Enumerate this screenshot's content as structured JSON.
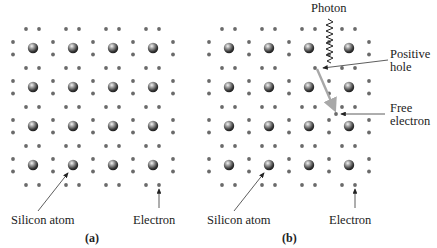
{
  "panels": [
    {
      "id": "a",
      "caption": "(a)",
      "offset_x": 0,
      "labels": {
        "silicon_atom": "Silicon atom",
        "electron": "Electron"
      }
    },
    {
      "id": "b",
      "caption": "(b)",
      "offset_x": 196,
      "labels": {
        "silicon_atom": "Silicon atom",
        "electron": "Electron",
        "photon": "Photon",
        "positive_hole_line1": "Positive",
        "positive_hole_line2": "hole",
        "free_electron_line1": "Free",
        "free_electron_line2": "electron"
      }
    }
  ],
  "lattice": {
    "atom_columns": 4,
    "atom_rows": 4,
    "atom_color": "#4a4a4a",
    "electron_color": "#6a6a6a",
    "photon_path_color": "#a8a8a8"
  }
}
